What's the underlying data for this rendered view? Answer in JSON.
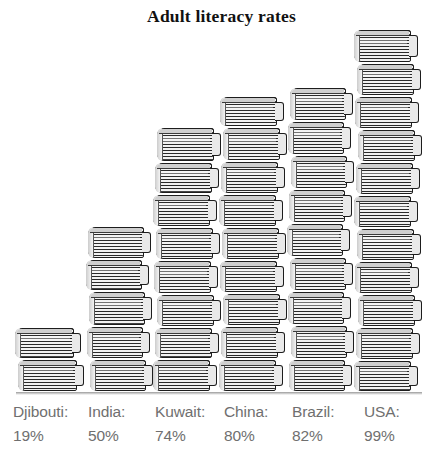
{
  "title": "Adult literacy rates",
  "colors": {
    "background": "#ffffff",
    "title_text": "#111111",
    "label_text": "#6f6f6f",
    "book_outline": "#1d1d1d",
    "book_pages": "#f2f2f2"
  },
  "chart_data": {
    "type": "bar",
    "title": "Adult literacy rates",
    "xlabel": "",
    "ylabel": "",
    "ylim": [
      0,
      100
    ],
    "grid": false,
    "legend": "none",
    "units": "percent",
    "pictorial_unit": "stacked books",
    "categories": [
      "Djibouti",
      "India",
      "Kuwait",
      "China",
      "Brazil",
      "USA"
    ],
    "values": [
      19,
      50,
      74,
      80,
      82,
      99
    ],
    "value_labels": [
      "19%",
      "50%",
      "74%",
      "80%",
      "82%",
      "99%"
    ],
    "books_per_stack": [
      2,
      5,
      8,
      9,
      9,
      11
    ]
  },
  "stacks": [
    {
      "country": "Djibouti",
      "name_label": "Djibouti:",
      "value_label": "19%",
      "value": 19,
      "books": 2,
      "left": 17,
      "width": 66,
      "label_left": 13,
      "book_heights": [
        32,
        33
      ]
    },
    {
      "country": "India",
      "name_label": "India:",
      "value_label": "50%",
      "value": 50,
      "books": 5,
      "left": 88,
      "width": 63,
      "label_left": 88,
      "book_heights": [
        33,
        32,
        35,
        33,
        33
      ]
    },
    {
      "country": "Kuwait",
      "name_label": "Kuwait:",
      "value_label": "74%",
      "value": 74,
      "books": 8,
      "left": 155,
      "width": 64,
      "label_left": 155,
      "book_heights": [
        35,
        32,
        33,
        33,
        34,
        33,
        32,
        33
      ]
    },
    {
      "country": "China",
      "name_label": "China:",
      "value_label": "80%",
      "value": 80,
      "books": 9,
      "left": 221,
      "width": 64,
      "label_left": 224,
      "book_heights": [
        31,
        34,
        33,
        33,
        33,
        33,
        33,
        33,
        33
      ]
    },
    {
      "country": "Brazil",
      "name_label": "Brazil:",
      "value_label": "82%",
      "value": 82,
      "books": 9,
      "left": 289,
      "width": 63,
      "label_left": 292,
      "book_heights": [
        34,
        34,
        34,
        34,
        34,
        34,
        34,
        34,
        33
      ]
    },
    {
      "country": "USA",
      "name_label": "USA:",
      "value_label": "99%",
      "value": 99,
      "books": 11,
      "left": 356,
      "width": 64,
      "label_left": 364,
      "book_heights": [
        34,
        33,
        33,
        33,
        33,
        33,
        33,
        33,
        33,
        33,
        32
      ]
    }
  ]
}
